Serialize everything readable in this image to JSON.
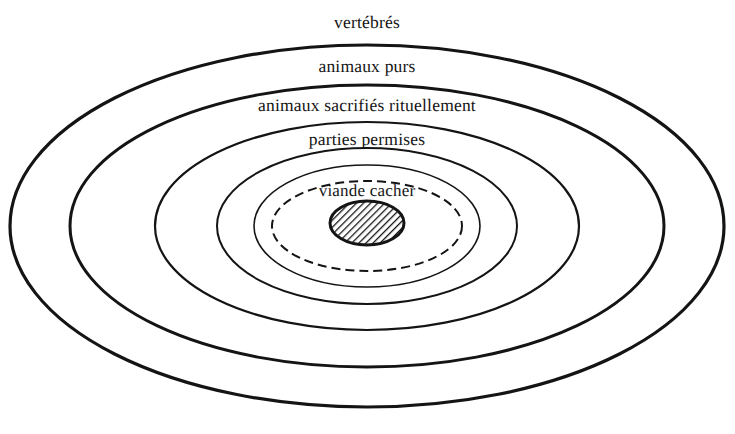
{
  "figure": {
    "background_color": "#ffffff",
    "stroke_color": "#141414",
    "text_color": "#141414",
    "center": {
      "x": 367,
      "y": 226
    },
    "rings": [
      {
        "id": "ring-vertebres",
        "label": "vertébrés",
        "level": 1,
        "style": "solid",
        "stroke_width": 3.2,
        "rx": 357,
        "ry": 181,
        "label_x": 367,
        "label_y": 22
      },
      {
        "id": "ring-animaux-purs",
        "label": "animaux purs",
        "level": 2,
        "style": "solid",
        "stroke_width": 3.0,
        "rx": 297,
        "ry": 141,
        "label_x": 367,
        "label_y": 66
      },
      {
        "id": "ring-animaux-sacrifies",
        "label": "animaux sacrifiés rituellement",
        "level": 3,
        "style": "solid",
        "stroke_width": 2.2,
        "rx": 212,
        "ry": 104,
        "label_x": 367,
        "label_y": 105
      },
      {
        "id": "ring-parties-permises",
        "label": "parties permises",
        "level": 4,
        "style": "solid",
        "stroke_width": 2.0,
        "rx": 150,
        "ry": 78,
        "label_x": 367,
        "label_y": 139
      },
      {
        "id": "ring-inner-solid",
        "label": "",
        "level": 5,
        "style": "solid",
        "stroke_width": 1.6,
        "rx": 113,
        "ry": 61,
        "label_x": 367,
        "label_y": 0
      },
      {
        "id": "ring-viande-cacher",
        "label": "viande cacher",
        "level": 6,
        "style": "dashed",
        "stroke_width": 2.0,
        "dash_pattern": "9 5",
        "rx": 95,
        "ry": 45,
        "label_x": 367,
        "label_y": 191
      }
    ],
    "core": {
      "id": "core-hatched-ellipse",
      "fill": "hatch-diagonal",
      "stroke_color": "#141414",
      "stroke_width": 3.0,
      "cx": 367,
      "cy": 223,
      "rx": 37,
      "ry": 22,
      "hatch_angle_deg": 45,
      "hatch_spacing": 5
    }
  }
}
